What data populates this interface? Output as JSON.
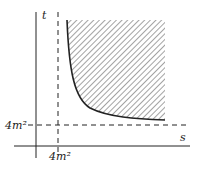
{
  "diagram": {
    "axes": {
      "x_label": "s",
      "y_label": "t"
    },
    "thresholds": {
      "s_threshold_label": "4m²",
      "t_threshold_label": "4m²"
    },
    "region": {
      "description": "hatched region above hyperbola-like curve bounded by s > 4m², t > 4m²"
    },
    "colors": {
      "line": "#222222",
      "hatch": "#555555",
      "background": "#ffffff"
    }
  }
}
